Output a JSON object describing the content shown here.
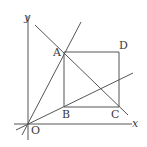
{
  "diagram": {
    "type": "geometry-figure",
    "stroke_color": "#4a4a4a",
    "axes": {
      "x_label": "x",
      "y_label": "y",
      "origin_label": "O"
    },
    "points": {
      "A": {
        "label": "A",
        "x": 64,
        "y": 52
      },
      "B": {
        "label": "B",
        "x": 64,
        "y": 107
      },
      "C": {
        "label": "C",
        "x": 119,
        "y": 107
      },
      "D": {
        "label": "D",
        "x": 119,
        "y": 52
      },
      "O": {
        "label": "O",
        "x": 28,
        "y": 124
      }
    },
    "shapes": [
      {
        "name": "rectangle-ABCD",
        "vertices": [
          "A",
          "B",
          "C",
          "D"
        ]
      }
    ],
    "lines": [
      {
        "name": "line-OA",
        "through": [
          "O",
          "A"
        ]
      },
      {
        "name": "line-AC",
        "through": [
          "A",
          "C"
        ]
      },
      {
        "name": "line-O-slope",
        "through": [
          "O",
          "B-ish"
        ]
      }
    ]
  }
}
